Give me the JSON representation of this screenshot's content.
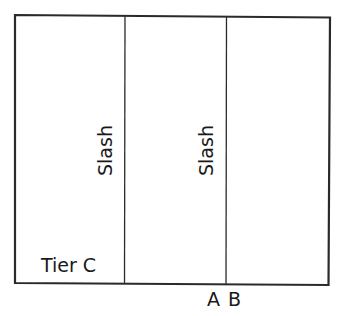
{
  "diagram": {
    "type": "partitioned-rectangle",
    "frame": {
      "stroke_color": "#2a2a2a",
      "background": "#ffffff"
    },
    "dividers": [
      {
        "position": "first",
        "label": "Slash"
      },
      {
        "position": "second",
        "label": "Slash"
      }
    ],
    "labels": {
      "bottom_left": "Tier C",
      "slash_1": "Slash",
      "slash_2": "Slash",
      "below_second_divider": "A B"
    }
  }
}
